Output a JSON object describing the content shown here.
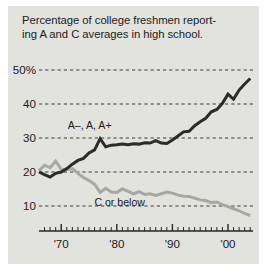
{
  "figure": {
    "title_line1": "Percentage of college freshmen report-",
    "title_line2": "ing A and C averages in high school.",
    "panel_bg": "#e2e2de",
    "page_bg": "#ffffff",
    "text_color": "#1b1b1b"
  },
  "axes": {
    "y_ticks": [
      {
        "value": 50,
        "label": "50%"
      },
      {
        "value": 40,
        "label": "40"
      },
      {
        "value": 30,
        "label": "30"
      },
      {
        "value": 20,
        "label": "20"
      },
      {
        "value": 10,
        "label": "10"
      }
    ],
    "x_ticks_major": [
      {
        "value": 1970,
        "label": "'70"
      },
      {
        "value": 1980,
        "label": "'80"
      },
      {
        "value": 1990,
        "label": "'90"
      },
      {
        "value": 2000,
        "label": "'00"
      }
    ],
    "x_minor_step": 1,
    "gridline_style": "dashed",
    "gridline_color": "#3a3a3a",
    "axis_line_color": "#262626"
  },
  "annotations": [
    {
      "name": "series-label-a",
      "text": "A–, A, A+",
      "x": 1976.2,
      "y": 33.6
    },
    {
      "name": "series-label-c",
      "text": "C or below",
      "x": 1981.0,
      "y": 10.9
    }
  ],
  "chart_data": {
    "type": "line",
    "xlabel": "",
    "ylabel": "",
    "xlim": [
      1966,
      2004.5
    ],
    "ylim": [
      4,
      53
    ],
    "grid": true,
    "legend": "inline-annotations",
    "x": [
      1966,
      1967,
      1968,
      1969,
      1970,
      1971,
      1972,
      1973,
      1974,
      1975,
      1976,
      1977,
      1978,
      1979,
      1980,
      1981,
      1982,
      1983,
      1984,
      1985,
      1986,
      1987,
      1988,
      1989,
      1990,
      1991,
      1992,
      1993,
      1994,
      1995,
      1996,
      1997,
      1998,
      1999,
      2000,
      2001,
      2002,
      2003,
      2004
    ],
    "series": [
      {
        "name": "A–, A, A+",
        "color": "#2b2b2b",
        "width": 3.0,
        "values": [
          20.0,
          19.2,
          18.5,
          19.6,
          20.0,
          21.0,
          22.3,
          23.4,
          24.0,
          25.6,
          26.5,
          29.8,
          27.4,
          27.9,
          28.0,
          28.2,
          28.0,
          28.3,
          28.2,
          28.6,
          28.5,
          29.2,
          28.5,
          28.4,
          29.4,
          30.6,
          31.8,
          32.0,
          33.6,
          34.8,
          35.8,
          37.7,
          38.4,
          40.2,
          42.9,
          41.4,
          44.1,
          45.9,
          47.5
        ]
      },
      {
        "name": "C or below",
        "color": "#a8a8a2",
        "width": 3.0,
        "values": [
          20.4,
          22.0,
          21.3,
          23.2,
          20.8,
          20.7,
          21.0,
          19.6,
          18.4,
          17.5,
          16.4,
          14.0,
          15.2,
          14.1,
          14.0,
          15.0,
          14.4,
          13.6,
          14.2,
          13.4,
          13.6,
          13.1,
          13.6,
          14.1,
          13.8,
          13.2,
          12.9,
          12.8,
          12.3,
          11.8,
          11.6,
          11.0,
          11.2,
          10.4,
          9.8,
          9.2,
          8.6,
          7.8,
          7.2
        ]
      }
    ]
  }
}
